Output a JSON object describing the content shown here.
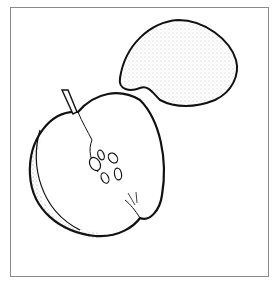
{
  "illustration": {
    "subject": "apple half and apple slice line drawing",
    "elements": [
      "apple-half",
      "apple-stem",
      "apple-seeds",
      "apple-slice"
    ],
    "colors": {
      "line": "#111111",
      "background": "#ffffff",
      "frame": "#8a8a8a"
    }
  }
}
